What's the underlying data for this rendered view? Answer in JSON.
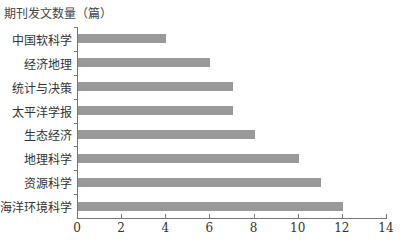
{
  "chart_data": {
    "type": "bar",
    "orientation": "horizontal",
    "title": "",
    "ylabel": "期刊发文数量（篇）",
    "xlabel": "",
    "categories": [
      "中国软科学",
      "经济地理",
      "统计与决策",
      "太平洋学报",
      "生态经济",
      "地理科学",
      "资源科学",
      "海洋环境科学"
    ],
    "values": [
      4,
      6,
      7,
      7,
      8,
      10,
      11,
      12
    ],
    "xlim": [
      0,
      14
    ],
    "xticks": [
      "0",
      "2",
      "4",
      "6",
      "8",
      "10",
      "12",
      "14"
    ],
    "grid": false,
    "legend": null,
    "bar_color": "#999999"
  }
}
